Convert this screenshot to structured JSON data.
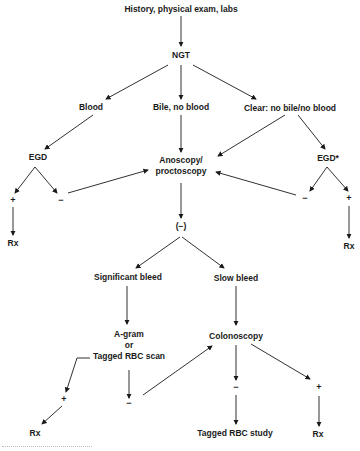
{
  "diagram": {
    "nodes": {
      "history": "History, physical exam, labs",
      "ngt": "NGT",
      "blood": "Blood",
      "bile": "Bile, no blood",
      "clear": "Clear: no bile/no blood",
      "egd_left": "EGD",
      "anoscopy_line1": "Anoscopy/",
      "anoscopy_line2": "proctoscopy",
      "egd_right": "EGD*",
      "rx_left": "Rx",
      "rx_right": "Rx",
      "negative_paren": "(−)",
      "significant": "Significant bleed",
      "slow": "Slow bleed",
      "agram_line1": "A-gram",
      "agram_line2": "or",
      "agram_line3": "Tagged RBC scan",
      "colonoscopy": "Colonoscopy",
      "rx_bottom_left": "Rx",
      "tagged_study": "Tagged RBC study",
      "rx_bottom_right": "Rx"
    },
    "signs": {
      "egd_left_pos": "+",
      "egd_left_neg": "−",
      "egd_right_neg": "−",
      "egd_right_pos": "+",
      "agram_pos": "+",
      "agram_neg": "−",
      "colon_neg": "−",
      "colon_pos": "+"
    }
  }
}
